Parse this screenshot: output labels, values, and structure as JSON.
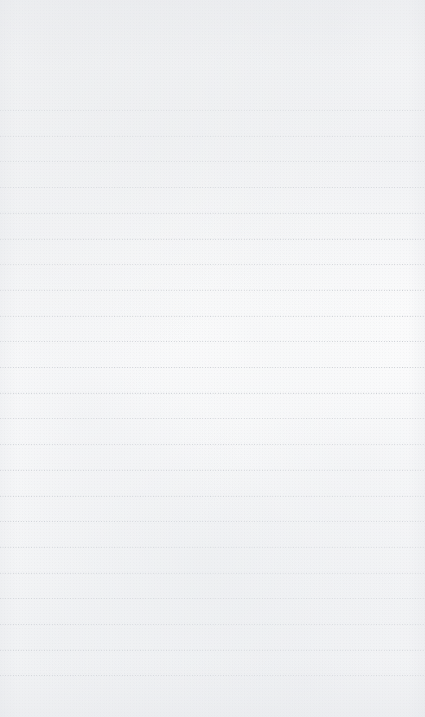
{
  "page": {
    "kind": "lined-notepad-page",
    "width_px": 425,
    "height_px": 717,
    "background_color": "#fdfdfd",
    "has_text_content": false,
    "content_text": ""
  },
  "ruling": {
    "line_count": 23,
    "first_line_y": 110,
    "last_line_y": 675,
    "line_spacing_px": 25.7,
    "line_color": "#b9bdc3",
    "line_style": "dotted",
    "line_thickness_px": 1,
    "extends_edge_to_edge": true,
    "left_inset_px": 0,
    "right_inset_px": 0,
    "top_margin_px": 110,
    "bottom_margin_px": 42,
    "line_y_positions": [
      110,
      135.7,
      161.4,
      187.1,
      212.8,
      238.5,
      264.2,
      289.9,
      315.6,
      341.3,
      367.0,
      392.7,
      418.4,
      444.1,
      469.8,
      495.5,
      521.2,
      546.9,
      572.6,
      598.3,
      624.0,
      649.7,
      675.4
    ]
  },
  "texture": {
    "type": "scanned-paper-grain",
    "grain_color": "#e7e9ec",
    "speckle_color": "#ced1d6",
    "vignette_color": "#e2e4e8"
  }
}
